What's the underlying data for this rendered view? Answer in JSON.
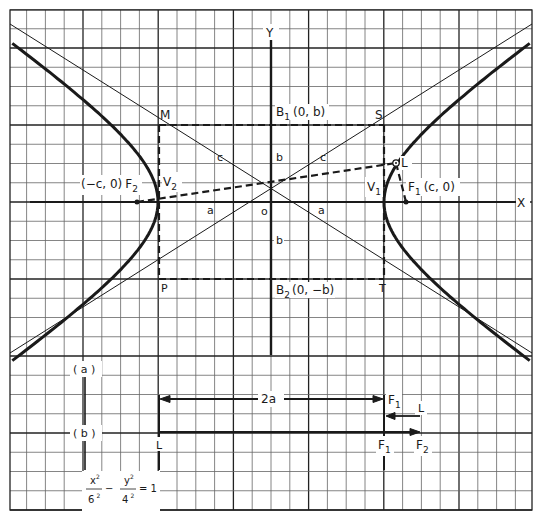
{
  "figure": {
    "equation": {
      "lhs_num_1": "x",
      "lhs_sup_1": "2",
      "lhs_den_1": "6",
      "lhs_densup_1": "2",
      "minus": "−",
      "lhs_num_2": "y",
      "lhs_sup_2": "2",
      "lhs_den_2": "4",
      "lhs_densup_2": "2",
      "rhs": "= 1"
    },
    "axes": {
      "x_label": "X",
      "y_label": "Y",
      "origin_label": "o"
    },
    "points": {
      "M": "M",
      "S": "S",
      "P": "P",
      "T": "T",
      "V1": "V",
      "V1_sub": "1",
      "V2": "V",
      "V2_sub": "2",
      "F1": "F",
      "F1_sub": "1",
      "F1_coords": "(c, 0)",
      "F2": "F",
      "F2_sub": "2",
      "F2_coords": "(−c, 0)",
      "B1": "B",
      "B1_sub": "1",
      "B1_coords": "(0, b)",
      "B2": "B",
      "B2_sub": "2",
      "B2_coords": "(0, −b)",
      "L": "L"
    },
    "segment_labels": {
      "c_left": "c",
      "c_right": "c",
      "a_left": "a",
      "a_right": "a",
      "b_top": "b",
      "b_bottom": "b"
    },
    "construction": {
      "step_a": "( a )",
      "step_b": "( b )",
      "two_a": "2a",
      "row_a_F1": "F",
      "row_a_F1_sub": "1",
      "row_a_L": "L",
      "row_b_L": "L",
      "row_b_F1": "F",
      "row_b_F1_sub": "1",
      "row_b_F2": "F",
      "row_b_F2_sub": "2"
    },
    "parameters": {
      "a": 6,
      "b": 4,
      "c": 7.21
    },
    "colors": {
      "ink": "#1a1a1a",
      "grid": "#555555",
      "paper": "#ffffff"
    }
  }
}
